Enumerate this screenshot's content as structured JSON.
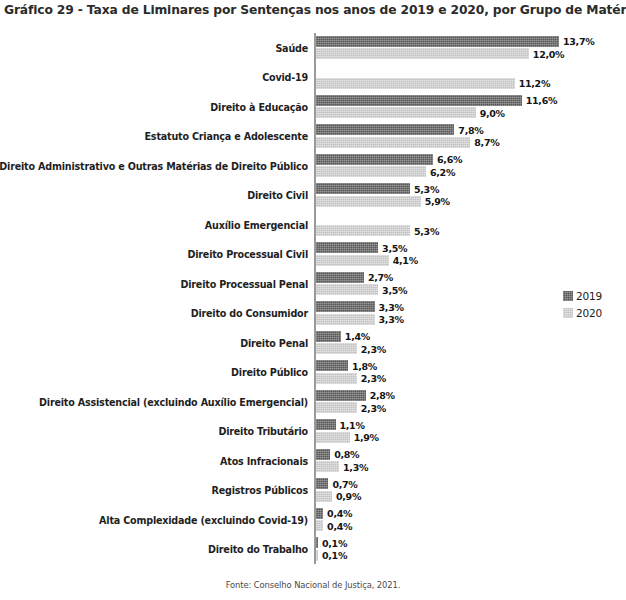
{
  "chart_data": {
    "type": "bar",
    "orientation": "horizontal",
    "title": "Gráfico 29 - Taxa de Liminares por Sentenças nos anos de 2019 e 2020, por Grupo de Matérias",
    "xlabel": "",
    "ylabel": "",
    "grid": false,
    "axis_visible": true,
    "xlim": [
      0,
      13.7
    ],
    "legend_position": "right-middle",
    "value_suffix": "%",
    "decimal_separator": ",",
    "categories": [
      "Saúde",
      "Covid-19",
      "Direito à Educação",
      "Estatuto Criança e Adolescente",
      "Direito Administrativo e Outras Matérias de Direito Público",
      "Direito Civil",
      "Auxílio Emergencial",
      "Direito Processual Civil",
      "Direito Processual Penal",
      "Direito do Consumidor",
      "Direito Penal",
      "Direito Público",
      "Direito Assistencial (excluindo Auxílio Emergencial)",
      "Direito Tributário",
      "Atos Infracionais",
      "Registros Públicos",
      "Alta Complexidade (excluindo Covid-19)",
      "Direito do Trabalho"
    ],
    "series": [
      {
        "name": "2019",
        "color": "#585858",
        "values": [
          13.7,
          null,
          11.6,
          7.8,
          6.6,
          5.3,
          null,
          3.5,
          2.7,
          3.3,
          1.4,
          1.8,
          2.8,
          1.1,
          0.8,
          0.7,
          0.4,
          0.1
        ],
        "labels": [
          "13,7%",
          "",
          "11,6%",
          "7,8%",
          "6,6%",
          "5,3%",
          "",
          "3,5%",
          "2,7%",
          "3,3%",
          "1,4%",
          "1,8%",
          "2,8%",
          "1,1%",
          "0,8%",
          "0,7%",
          "0,4%",
          "0,1%"
        ]
      },
      {
        "name": "2020",
        "color": "#c2c2c2",
        "values": [
          12.0,
          11.2,
          9.0,
          8.7,
          6.2,
          5.9,
          5.3,
          4.1,
          3.5,
          3.3,
          2.3,
          2.3,
          2.3,
          1.9,
          1.3,
          0.9,
          0.4,
          0.1
        ],
        "labels": [
          "12,0%",
          "11,2%",
          "9,0%",
          "8,7%",
          "6,2%",
          "5,9%",
          "5,3%",
          "4,1%",
          "3,5%",
          "3,3%",
          "2,3%",
          "2,3%",
          "2,3%",
          "1,9%",
          "1,3%",
          "0,9%",
          "0,4%",
          "0,1%"
        ]
      }
    ]
  },
  "legend": {
    "items": [
      {
        "label": "2019",
        "color": "#585858"
      },
      {
        "label": "2020",
        "color": "#c2c2c2"
      }
    ]
  },
  "source": {
    "text": "Fonte: Conselho Nacional de Justiça, 2021."
  }
}
